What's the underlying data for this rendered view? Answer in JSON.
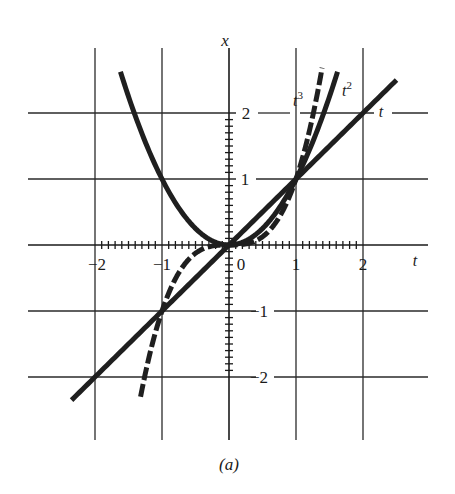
{
  "figure": {
    "caption": "(a)",
    "colors": {
      "ink": "#1f1f1f",
      "background": "#ffffff"
    }
  },
  "chart_data": {
    "type": "line",
    "title": "",
    "caption": "(a)",
    "xlabel": "t",
    "ylabel": "x",
    "xlim": [
      -2.8,
      3.0
    ],
    "ylim": [
      -3.0,
      3.0
    ],
    "grid": true,
    "x_ticks": [
      -2,
      -1,
      0,
      1,
      2
    ],
    "x_tick_labels": [
      "−2",
      "−1",
      "0",
      "1",
      "2"
    ],
    "y_ticks": [
      -2,
      -1,
      1,
      2
    ],
    "y_tick_labels": [
      "−2",
      "−1",
      "1",
      "2"
    ],
    "minor_ticks_per_unit": 10,
    "series": [
      {
        "name": "t",
        "label": "t",
        "expression": "x = t",
        "style": "solid",
        "t_range": [
          -2.35,
          2.5
        ]
      },
      {
        "name": "t^2",
        "label": "t²",
        "expression": "x = t^2",
        "style": "solid",
        "t_range": [
          -1.62,
          1.62
        ]
      },
      {
        "name": "t^3",
        "label": "t³",
        "expression": "x = t^3",
        "style": "dashed",
        "t_range": [
          -1.32,
          1.39
        ]
      }
    ],
    "sample_points": {
      "t": [
        -2,
        -1.5,
        -1,
        -0.5,
        0,
        0.5,
        1,
        1.5,
        2
      ],
      "t^2": [
        null,
        2.25,
        1,
        0.25,
        0,
        0.25,
        1,
        2.25,
        null
      ],
      "t^3": [
        null,
        null,
        -1,
        -0.125,
        0,
        0.125,
        1,
        null,
        null
      ]
    },
    "intersections": [
      [
        0,
        0
      ],
      [
        1,
        1
      ],
      [
        -1,
        -1
      ]
    ]
  },
  "labels": {
    "x_axis": "x",
    "t_axis": "t",
    "series_t": "t",
    "series_t2_base": "t",
    "series_t2_exp": "2",
    "series_t3_base": "t",
    "series_t3_exp": "3",
    "tick_t_m2": "−2",
    "tick_t_m1": "−1",
    "tick_t_0": "0",
    "tick_t_1": "1",
    "tick_t_2": "2",
    "tick_x_2": "2",
    "tick_x_1": "1",
    "tick_x_m1": "−1",
    "tick_x_m2": "−2"
  }
}
